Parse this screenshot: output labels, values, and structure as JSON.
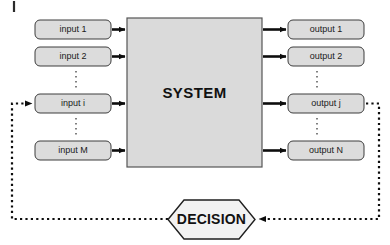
{
  "diagram": {
    "title": "SYSTEM",
    "system_block": {
      "label": "SYSTEM",
      "fill_color": "#dadada",
      "border_color": "#555555"
    },
    "decision_block": {
      "label": "DECISION",
      "shape": "hexagon",
      "fill_color": "#f2f2f2",
      "border_color": "#1f1f1f"
    },
    "inputs": [
      {
        "label": "input 1"
      },
      {
        "label": "input 2"
      },
      {
        "label": "input i"
      },
      {
        "label": "input M"
      }
    ],
    "outputs": [
      {
        "label": "output 1"
      },
      {
        "label": "output 2"
      },
      {
        "label": "output j"
      },
      {
        "label": "output N"
      }
    ],
    "ellipses": {
      "input_gap": "vertical-dots",
      "output_gap": "vertical-dots"
    },
    "connectors": {
      "input_arrows": "solid-arrow",
      "output_arrows": "solid-arrow",
      "feedback_style": "dotted",
      "feedback_from": "output j",
      "feedback_to": "input i"
    },
    "colors": {
      "box_fill": "#dcdcdc",
      "system_fill": "#dadada",
      "decision_fill": "#f2f2f2",
      "line": "#0d0d0d",
      "background": "#ffffff"
    }
  }
}
